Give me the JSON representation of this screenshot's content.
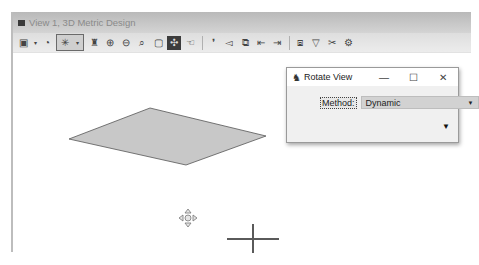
{
  "view_window": {
    "title": "View 1, 3D Metric Design",
    "toolbar": [
      {
        "name": "view-display-mode-icon",
        "glyph": "▣"
      },
      {
        "name": "dropdown-arrow-icon",
        "glyph": "▾"
      },
      {
        "name": "view-attributes-icon",
        "glyph": "◔"
      },
      {
        "name": "lighting-icon",
        "glyph": "✳"
      },
      {
        "name": "dropdown-arrow-icon",
        "glyph": "▾"
      },
      {
        "name": "update-view-brush-icon",
        "glyph": "♜"
      },
      {
        "name": "zoom-in-icon",
        "glyph": "⊕"
      },
      {
        "name": "zoom-out-icon",
        "glyph": "⊖"
      },
      {
        "name": "window-area-icon",
        "glyph": "⌕"
      },
      {
        "name": "fit-view-icon",
        "glyph": "▢"
      },
      {
        "name": "rotate-view-icon",
        "glyph": "✣"
      },
      {
        "name": "pan-view-icon",
        "glyph": "☜"
      },
      {
        "name": "walk-icon",
        "glyph": "❜"
      },
      {
        "name": "camera-icon",
        "glyph": "◅"
      },
      {
        "name": "view-previous-icon",
        "glyph": "⧉"
      },
      {
        "name": "view-back-icon",
        "glyph": "⇤"
      },
      {
        "name": "view-forward-icon",
        "glyph": "⇥"
      },
      {
        "name": "copy-view-icon",
        "glyph": "⧈"
      },
      {
        "name": "clip-volume-icon",
        "glyph": "▽"
      },
      {
        "name": "clip-mask-icon",
        "glyph": "✂"
      },
      {
        "name": "view-settings-icon",
        "glyph": "⚙"
      }
    ]
  },
  "rotate_dialog": {
    "title": "Rotate View",
    "minimize": "—",
    "maximize": "☐",
    "close": "✕",
    "method_label": "Method:",
    "method_value": "Dynamic",
    "select_arrow": "▼",
    "expand_arrow": "▼"
  },
  "canvas": {
    "cursor": "rotate-cursor",
    "crosshair": "view-center-crosshair"
  }
}
